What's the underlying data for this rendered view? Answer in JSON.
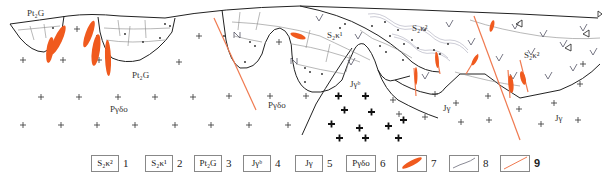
{
  "diagram": {
    "type": "geological-cross-section",
    "labels": {
      "pt_top": "Pt₂G",
      "pt_bottom": "Pt₂G",
      "s2k1": "S₂κ¹",
      "s2k2_mid": "S₂κ²",
      "s2k2_right": "S₂κ²",
      "jyb": "Jγᵇ",
      "pydo_left": "Pγδο",
      "pydo_mid": "Pγδο",
      "jy_mid": "Jγ",
      "jy_right": "Jγ"
    },
    "colors": {
      "vein": "#f05a1e",
      "fault": "#f07a50",
      "boundary": "#222222",
      "contact_line": "#9aa0a8"
    }
  },
  "legend": {
    "items": [
      {
        "symbol": "S₂κ²",
        "number": "1"
      },
      {
        "symbol": "S₂κ¹",
        "number": "2"
      },
      {
        "symbol": "Pt₂G",
        "number": "3"
      },
      {
        "symbol": "Jγᵇ",
        "number": "4"
      },
      {
        "symbol": "Jγ",
        "number": "5"
      },
      {
        "symbol": "Pγδο",
        "number": "6"
      },
      {
        "symbol": "orange-vein",
        "number": "7"
      },
      {
        "symbol": "grey-line",
        "number": "8"
      },
      {
        "symbol": "orange-line",
        "number": "9"
      }
    ]
  }
}
